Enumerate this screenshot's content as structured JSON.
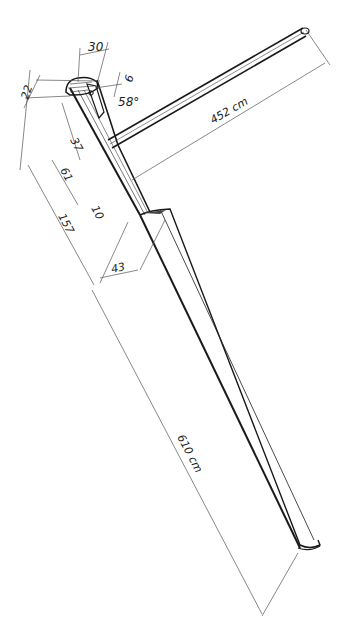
{
  "diagram": {
    "colors": {
      "ink": "#1a1a1a",
      "dimension_line": "#555555",
      "background": "#ffffff"
    },
    "dimensions": [
      {
        "id": "head_width",
        "label": "30"
      },
      {
        "id": "head_height",
        "label": "22"
      },
      {
        "id": "tiller_offset",
        "label": "9"
      },
      {
        "id": "tiller_angle",
        "label": "58°"
      },
      {
        "id": "tiller_length",
        "label": "452 cm"
      },
      {
        "id": "dist_37",
        "label": "37"
      },
      {
        "id": "dist_61",
        "label": "61"
      },
      {
        "id": "dist_10",
        "label": "10"
      },
      {
        "id": "dist_157",
        "label": "157"
      },
      {
        "id": "blade_width_top",
        "label": "43"
      },
      {
        "id": "total_length",
        "label": "610 cm"
      }
    ]
  }
}
